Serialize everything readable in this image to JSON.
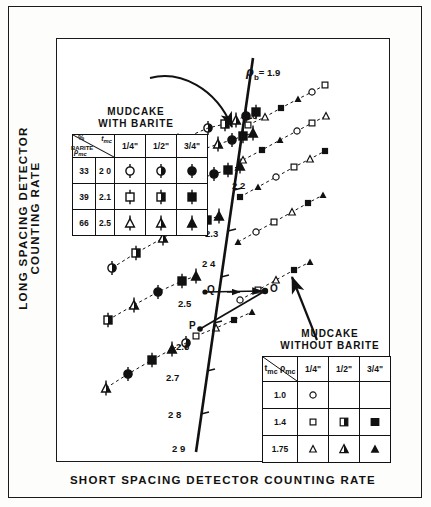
{
  "axes": {
    "ylabel": "LONG SPACING DETECTOR COUNTING RATE",
    "xlabel": "SHORT SPACING DETECTOR COUNTING RATE"
  },
  "spine": {
    "curve_label_symbol": "ρ",
    "curve_label_sub": "b",
    "curve_label_value": "= 1.9",
    "tick_labels": [
      "2 0",
      "2 2",
      "2.3",
      "2 4",
      "2.5",
      "2.6",
      "2.7",
      "2 8",
      "2 9"
    ]
  },
  "point_labels": [
    "Q",
    "O",
    "P"
  ],
  "legend_barite": {
    "title_line1": "MUDCAKE",
    "title_line2": "WITH BARITE",
    "corner_top": "t",
    "corner_top_sub": "mc",
    "corner_bottom": "ρ",
    "corner_bottom_sub": "mc",
    "col_headers": [
      "1/4\"",
      "1/2\"",
      "3/4\""
    ],
    "row_header_line1": "%",
    "row_header_line2": "BARITE",
    "rows": [
      {
        "barite": "33",
        "rho": "2 0",
        "symbols": [
          "circle-tick-open",
          "circle-tick-half",
          "circle-tick-filled"
        ]
      },
      {
        "barite": "39",
        "rho": "2.1",
        "symbols": [
          "square-tick-open",
          "square-tick-half",
          "square-tick-filled"
        ]
      },
      {
        "barite": "66",
        "rho": "2.5",
        "symbols": [
          "triangle-tick-open",
          "triangle-tick-half",
          "triangle-tick-filled"
        ]
      }
    ]
  },
  "legend_nobarite": {
    "title_line1": "MUDCAKE",
    "title_line2": "WITHOUT BARITE",
    "corner_top": "t",
    "corner_top_sub": "mc",
    "corner_bottom": "ρ",
    "corner_bottom_sub": "mc",
    "col_headers": [
      "1/4\"",
      "1/2\"",
      "3/4\""
    ],
    "rows": [
      {
        "rho": "1.0",
        "symbols": [
          "circle-open",
          "",
          ""
        ]
      },
      {
        "rho": "1.4",
        "symbols": [
          "square-open",
          "square-half",
          "square-filled"
        ]
      },
      {
        "rho": "1.75",
        "symbols": [
          "triangle-open",
          "triangle-half",
          "triangle-filled"
        ]
      }
    ]
  },
  "chart_data": {
    "type": "scatter",
    "title": "",
    "xlabel": "SHORT SPACING DETECTOR COUNTING RATE",
    "ylabel": "LONG SPACING DETECTOR COUNTING RATE",
    "grid": false,
    "legend_position": "inset-upper-left-and-lower-right",
    "spine": {
      "name": "rho_b spine",
      "label": "ρb = 1.9",
      "density_ticks": [
        1.9,
        2.0,
        2.2,
        2.3,
        2.4,
        2.5,
        2.6,
        2.7,
        2.8,
        2.9
      ],
      "points": [
        [
          253,
          58
        ],
        [
          196,
          452
        ]
      ]
    },
    "annotated_points": [
      {
        "name": "Q",
        "x": 205,
        "y": 292
      },
      {
        "name": "O",
        "x": 265,
        "y": 291
      },
      {
        "name": "P",
        "x": 200,
        "y": 329
      }
    ],
    "ribs": [
      {
        "name": "rib-1",
        "barite": true,
        "points": [
          [
            127,
            171
          ],
          [
            150,
            157
          ],
          [
            178,
            141
          ],
          [
            208,
            128
          ],
          [
            225,
            124
          ],
          [
            236,
            120
          ],
          [
            246,
            116
          ],
          [
            256,
            112
          ]
        ]
      },
      {
        "name": "rib-2",
        "barite": true,
        "points": [
          [
            110,
            196
          ],
          [
            136,
            181
          ],
          [
            163,
            168
          ],
          [
            196,
            152
          ],
          [
            218,
            144
          ],
          [
            232,
            140
          ],
          [
            243,
            136
          ],
          [
            253,
            133
          ]
        ]
      },
      {
        "name": "rib-3",
        "barite": true,
        "points": [
          [
            105,
            228
          ],
          [
            130,
            212
          ],
          [
            158,
            197
          ],
          [
            190,
            182
          ],
          [
            214,
            174
          ],
          [
            228,
            170
          ],
          [
            240,
            166
          ]
        ]
      },
      {
        "name": "rib-4",
        "barite": true,
        "points": [
          [
            112,
            268
          ],
          [
            136,
            253
          ],
          [
            163,
            238
          ],
          [
            190,
            226
          ],
          [
            207,
            220
          ],
          [
            219,
            216
          ]
        ]
      },
      {
        "name": "rib-5",
        "barite": true,
        "points": [
          [
            108,
            320
          ],
          [
            134,
            305
          ],
          [
            158,
            292
          ],
          [
            182,
            281
          ],
          [
            196,
            276
          ]
        ]
      },
      {
        "name": "rib-6",
        "barite": true,
        "points": [
          [
            106,
            388
          ],
          [
            128,
            374
          ],
          [
            152,
            360
          ],
          [
            172,
            349
          ],
          [
            186,
            343
          ]
        ]
      },
      {
        "name": "rib-7",
        "barite": false,
        "points": [
          [
            248,
            125
          ],
          [
            265,
            117
          ],
          [
            281,
            108
          ],
          [
            298,
            99
          ],
          [
            312,
            92
          ],
          [
            325,
            85
          ]
        ]
      },
      {
        "name": "rib-8",
        "barite": false,
        "points": [
          [
            243,
            160
          ],
          [
            262,
            150
          ],
          [
            280,
            140
          ],
          [
            297,
            131
          ],
          [
            312,
            123
          ],
          [
            326,
            116
          ]
        ]
      },
      {
        "name": "rib-9",
        "barite": false,
        "points": [
          [
            240,
            197
          ],
          [
            258,
            187
          ],
          [
            276,
            177
          ],
          [
            294,
            167
          ],
          [
            310,
            159
          ],
          [
            325,
            151
          ]
        ]
      },
      {
        "name": "rib-10",
        "barite": false,
        "points": [
          [
            238,
            242
          ],
          [
            256,
            232
          ],
          [
            274,
            222
          ],
          [
            292,
            212
          ],
          [
            308,
            203
          ],
          [
            323,
            195
          ]
        ]
      },
      {
        "name": "rib-11",
        "barite": false,
        "points": [
          [
            240,
            300
          ],
          [
            258,
            290
          ],
          [
            276,
            280
          ],
          [
            294,
            270
          ],
          [
            310,
            262
          ]
        ]
      },
      {
        "name": "rib-12",
        "barite": false,
        "points": [
          [
            196,
            336
          ],
          [
            216,
            328
          ],
          [
            234,
            320
          ],
          [
            252,
            312
          ]
        ]
      }
    ]
  }
}
